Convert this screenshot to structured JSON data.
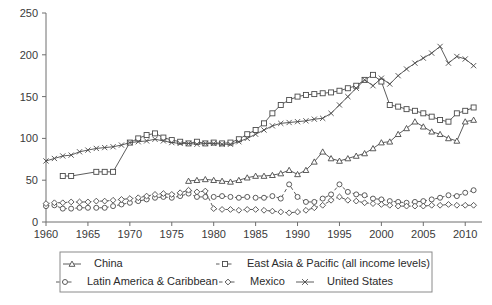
{
  "chart_data": {
    "type": "line",
    "title": "",
    "subtitle": "",
    "xlabel": "",
    "ylabel": "",
    "xlim": [
      1960,
      2012
    ],
    "ylim": [
      0,
      250
    ],
    "grid": false,
    "legend_position": "bottom",
    "y_ticks": [
      0,
      50,
      100,
      150,
      200,
      250
    ],
    "x_ticks": [
      1960,
      1965,
      1970,
      1975,
      1980,
      1985,
      1990,
      1995,
      2000,
      2005,
      2010
    ],
    "series": [
      {
        "name": "China",
        "marker": "triangle",
        "line": "solid",
        "x": [
          1977,
          1978,
          1979,
          1980,
          1981,
          1982,
          1983,
          1984,
          1985,
          1986,
          1987,
          1988,
          1989,
          1990,
          1991,
          1992,
          1993,
          1994,
          1995,
          1996,
          1997,
          1998,
          1999,
          2000,
          2001,
          2002,
          2003,
          2004,
          2005,
          2006,
          2007,
          2008,
          2009,
          2010,
          2011
        ],
        "y": [
          49,
          50,
          51,
          50,
          49,
          48,
          50,
          53,
          55,
          55,
          56,
          58,
          62,
          57,
          62,
          72,
          84,
          76,
          73,
          76,
          79,
          82,
          88,
          95,
          96,
          105,
          112,
          120,
          114,
          108,
          105,
          100,
          97,
          120,
          122
        ]
      },
      {
        "name": "East Asia & Pacific (all income levels)",
        "marker": "square",
        "line": "dotted-solid",
        "x": [
          1962,
          1963,
          1966,
          1967,
          1968,
          1970,
          1971,
          1972,
          1973,
          1974,
          1975,
          1976,
          1977,
          1978,
          1979,
          1980,
          1981,
          1982,
          1983,
          1984,
          1985,
          1986,
          1987,
          1988,
          1989,
          1990,
          1991,
          1992,
          1993,
          1994,
          1995,
          1996,
          1997,
          1998,
          1999,
          2000,
          2001,
          2002,
          2003,
          2004,
          2005,
          2006,
          2007,
          2008,
          2009,
          2010,
          2011
        ],
        "y": [
          55,
          55,
          60,
          60,
          60,
          95,
          100,
          104,
          106,
          101,
          98,
          96,
          94,
          96,
          94,
          95,
          94,
          95,
          99,
          105,
          110,
          118,
          130,
          140,
          146,
          150,
          152,
          153,
          154,
          155,
          157,
          160,
          163,
          170,
          176,
          168,
          140,
          138,
          135,
          133,
          130,
          126,
          122,
          120,
          130,
          133,
          137
        ]
      },
      {
        "name": "Latin America & Caribbean",
        "marker": "circle",
        "line": "dashed",
        "x": [
          1960,
          1961,
          1962,
          1963,
          1964,
          1965,
          1966,
          1967,
          1968,
          1969,
          1970,
          1971,
          1972,
          1973,
          1974,
          1975,
          1976,
          1977,
          1978,
          1979,
          1980,
          1981,
          1982,
          1983,
          1984,
          1985,
          1986,
          1987,
          1988,
          1989,
          1990,
          1991,
          1992,
          1993,
          1994,
          1995,
          1996,
          1997,
          1998,
          1999,
          2000,
          2001,
          2002,
          2003,
          2004,
          2005,
          2006,
          2007,
          2008,
          2009,
          2010,
          2011
        ],
        "y": [
          19,
          20,
          16,
          16,
          17,
          17,
          17,
          17,
          19,
          21,
          23,
          25,
          27,
          29,
          30,
          29,
          31,
          34,
          30,
          30,
          30,
          31,
          30,
          29,
          30,
          29,
          29,
          31,
          28,
          45,
          30,
          24,
          24,
          28,
          33,
          45,
          36,
          33,
          32,
          28,
          27,
          25,
          24,
          23,
          24,
          25,
          27,
          29,
          32,
          31,
          35,
          38
        ]
      },
      {
        "name": "Mexico",
        "marker": "diamond",
        "line": "dotted",
        "x": [
          1960,
          1961,
          1962,
          1963,
          1964,
          1965,
          1966,
          1967,
          1968,
          1969,
          1970,
          1971,
          1972,
          1973,
          1974,
          1975,
          1976,
          1977,
          1978,
          1979,
          1980,
          1981,
          1982,
          1983,
          1984,
          1985,
          1986,
          1987,
          1988,
          1989,
          1990,
          1991,
          1992,
          1993,
          1994,
          1995,
          1996,
          1997,
          1998,
          1999,
          2000,
          2001,
          2002,
          2003,
          2004,
          2005,
          2006,
          2007,
          2008,
          2009,
          2010,
          2011
        ],
        "y": [
          22,
          23,
          23,
          24,
          24,
          24,
          25,
          25,
          26,
          27,
          28,
          29,
          31,
          33,
          34,
          33,
          35,
          38,
          36,
          37,
          16,
          15,
          15,
          14,
          15,
          15,
          14,
          13,
          12,
          11,
          12,
          14,
          17,
          20,
          26,
          30,
          26,
          25,
          23,
          22,
          21,
          20,
          19,
          19,
          19,
          19,
          20,
          20,
          21,
          20,
          20,
          20
        ]
      },
      {
        "name": "United States",
        "marker": "x",
        "line": "solid",
        "x": [
          1960,
          1961,
          1962,
          1963,
          1964,
          1965,
          1966,
          1967,
          1968,
          1969,
          1970,
          1971,
          1972,
          1973,
          1974,
          1975,
          1976,
          1977,
          1978,
          1979,
          1980,
          1981,
          1982,
          1983,
          1984,
          1985,
          1986,
          1987,
          1988,
          1989,
          1990,
          1991,
          1992,
          1993,
          1994,
          1995,
          1996,
          1997,
          1998,
          1999,
          2000,
          2001,
          2002,
          2003,
          2004,
          2005,
          2006,
          2007,
          2008,
          2009,
          2010,
          2011
        ],
        "y": [
          73,
          76,
          79,
          80,
          84,
          86,
          88,
          89,
          90,
          92,
          95,
          96,
          97,
          99,
          97,
          95,
          94,
          94,
          93,
          94,
          94,
          93,
          93,
          96,
          100,
          105,
          110,
          115,
          118,
          119,
          120,
          121,
          123,
          124,
          130,
          140,
          150,
          160,
          170,
          163,
          172,
          165,
          175,
          183,
          190,
          196,
          202,
          210,
          190,
          198,
          195,
          187
        ]
      }
    ]
  },
  "legend": {
    "entries": [
      {
        "label": "China",
        "marker": "triangle",
        "line": "solid"
      },
      {
        "label": "East Asia & Pacific (all income levels)",
        "marker": "square",
        "line": "dotted"
      },
      {
        "label": "Latin America & Caribbean",
        "marker": "circle",
        "line": "dashed"
      },
      {
        "label": "Mexico",
        "marker": "diamond",
        "line": "dotted"
      },
      {
        "label": "United States",
        "marker": "x",
        "line": "solid"
      }
    ]
  },
  "colors": {
    "axis": "#6e6e6e",
    "series": "#4a4a4a",
    "text": "#2b2b2b",
    "background": "#ffffff"
  }
}
